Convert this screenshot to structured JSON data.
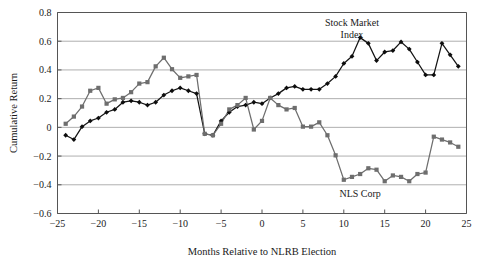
{
  "figure": {
    "top_partial_text": "",
    "annotations": [
      {
        "name": "stock-market-index-label",
        "text": "Stock Market",
        "x": 11.0,
        "y": 0.705
      },
      {
        "name": "stock-market-index-label-2",
        "text": "Index",
        "x": 11.0,
        "y": 0.625
      },
      {
        "name": "nls-corp-label",
        "text": "NLS Corp",
        "x": 12.0,
        "y": -0.485
      }
    ],
    "colors": {
      "series_a": "#141414",
      "series_b": "#6e6e6e",
      "gridline": "#9a9a9a",
      "axis": "#555555",
      "background": "#ffffff"
    }
  },
  "chart_data": {
    "type": "line",
    "title": "",
    "xlabel": "Months Relative to NLRB Election",
    "ylabel": "Cumulative Return",
    "xlim": [
      -25,
      25
    ],
    "ylim": [
      -0.6,
      0.8
    ],
    "xticks": [
      -25,
      -20,
      -15,
      -10,
      -5,
      0,
      5,
      10,
      15,
      20,
      25
    ],
    "xticklabels": [
      "−25",
      "−20",
      "−15",
      "−10",
      "−5",
      "0",
      "5",
      "10",
      "15",
      "20",
      "25"
    ],
    "yticks": [
      -0.6,
      -0.4,
      -0.2,
      0,
      0.2,
      0.4,
      0.6,
      0.8
    ],
    "yticklabels": [
      "−0.6",
      "−0.4",
      "−0.2",
      "0",
      "0.2",
      "0.4",
      "0.6",
      "0.8"
    ],
    "grid": "horizontal",
    "legend_position": "inline-annotation",
    "x": [
      -24,
      -23,
      -22,
      -21,
      -20,
      -19,
      -18,
      -17,
      -16,
      -15,
      -14,
      -13,
      -12,
      -11,
      -10,
      -9,
      -8,
      -7,
      -6,
      -5,
      -4,
      -3,
      -2,
      -1,
      0,
      1,
      2,
      3,
      4,
      5,
      6,
      7,
      8,
      9,
      10,
      11,
      12,
      13,
      14,
      15,
      16,
      17,
      18,
      19,
      20,
      21,
      22,
      23,
      24
    ],
    "series": [
      {
        "name": "Stock Market Index",
        "color": "#141414",
        "marker": "diamond",
        "values": [
          -0.055,
          -0.085,
          0.005,
          0.045,
          0.065,
          0.105,
          0.125,
          0.175,
          0.185,
          0.175,
          0.155,
          0.175,
          0.225,
          0.255,
          0.275,
          0.255,
          0.235,
          -0.045,
          -0.055,
          0.045,
          0.105,
          0.145,
          0.155,
          0.175,
          0.165,
          0.205,
          0.235,
          0.275,
          0.285,
          0.265,
          0.265,
          0.265,
          0.305,
          0.355,
          0.445,
          0.495,
          0.625,
          0.585,
          0.465,
          0.525,
          0.535,
          0.595,
          0.545,
          0.455,
          0.365,
          0.365,
          0.585,
          0.505,
          0.425
        ]
      },
      {
        "name": "NLS Corp",
        "color": "#6e6e6e",
        "marker": "square",
        "values": [
          0.025,
          0.075,
          0.145,
          0.255,
          0.275,
          0.165,
          0.195,
          0.205,
          0.245,
          0.305,
          0.315,
          0.425,
          0.485,
          0.405,
          0.345,
          0.355,
          0.365,
          -0.045,
          -0.055,
          0.025,
          0.125,
          0.155,
          0.205,
          -0.015,
          0.045,
          0.205,
          0.155,
          0.125,
          0.135,
          0.005,
          0.005,
          0.035,
          -0.055,
          -0.195,
          -0.365,
          -0.345,
          -0.325,
          -0.285,
          -0.295,
          -0.375,
          -0.335,
          -0.345,
          -0.375,
          -0.325,
          -0.315,
          -0.065,
          -0.085,
          -0.105,
          -0.135
        ]
      }
    ]
  }
}
